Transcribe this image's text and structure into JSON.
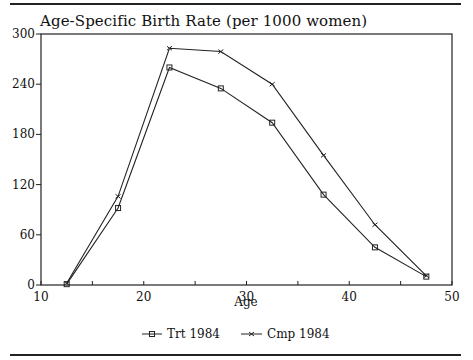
{
  "chart_data": {
    "type": "line",
    "title": "Age-Specific Birth Rate (per 1000 women)",
    "xlabel": "Age",
    "ylabel": "",
    "xlim": [
      10,
      50
    ],
    "ylim": [
      0,
      300
    ],
    "xticks": [
      10,
      20,
      30,
      40,
      50
    ],
    "xminor_ticks": [
      15,
      25,
      35,
      45
    ],
    "yticks": [
      0,
      60,
      120,
      180,
      240,
      300
    ],
    "grid": false,
    "legend_position": "bottom",
    "x": [
      12.5,
      17.5,
      22.5,
      27.5,
      32.5,
      37.5,
      42.5,
      47.5
    ],
    "series": [
      {
        "name": "Trt 1984",
        "marker": "square",
        "values": [
          1,
          92,
          260,
          235,
          194,
          108,
          45,
          10
        ]
      },
      {
        "name": "Cmp 1984",
        "marker": "x",
        "values": [
          2,
          106,
          283,
          279,
          240,
          155,
          72,
          11
        ]
      }
    ]
  },
  "legend": {
    "trt": "Trt 1984",
    "cmp": "Cmp 1984"
  }
}
